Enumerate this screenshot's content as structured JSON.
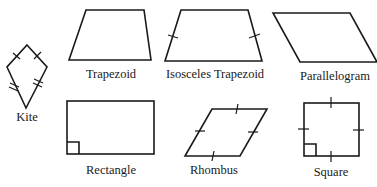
{
  "diagram": {
    "title": "",
    "shapes": [
      {
        "id": "kite",
        "label": "Kite",
        "marks": "two pairs of congruent adjacent sides (single and double ticks)"
      },
      {
        "id": "trapezoid",
        "label": "Trapezoid",
        "marks": "none"
      },
      {
        "id": "isosceles-trapezoid",
        "label": "Isosceles Trapezoid",
        "marks": "congruent legs (single ticks)"
      },
      {
        "id": "parallelogram",
        "label": "Parallelogram",
        "marks": "none"
      },
      {
        "id": "rectangle",
        "label": "Rectangle",
        "marks": "right angle marker"
      },
      {
        "id": "rhombus",
        "label": "Rhombus",
        "marks": "four congruent sides (single ticks)"
      },
      {
        "id": "square",
        "label": "Square",
        "marks": "four congruent sides and right angle marker"
      }
    ]
  },
  "colors": {
    "stroke": "#1a1a1a",
    "background": "#ffffff"
  }
}
